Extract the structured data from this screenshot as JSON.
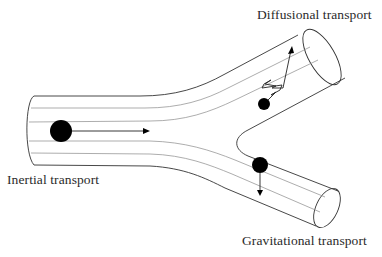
{
  "diagram": {
    "type": "bifurcating-airway-particle-transport",
    "labels": {
      "diffusional": "Diffusional transport",
      "inertial": "Inertial transport",
      "gravitational": "Gravitational transport"
    },
    "colors": {
      "outline": "#333333",
      "streamline": "#8a8a8a",
      "particle": "#000000",
      "text": "#2a2a2a",
      "background": "#ffffff"
    },
    "particles": [
      {
        "id": "inertial",
        "cx": 61,
        "cy": 131,
        "r": 11,
        "arrow": "right"
      },
      {
        "id": "diffusional",
        "cx": 264,
        "cy": 104,
        "r": 6,
        "arrow": "zigzag-up-right"
      },
      {
        "id": "gravitational",
        "cx": 260,
        "cy": 165,
        "r": 8,
        "arrow": "down"
      }
    ]
  }
}
